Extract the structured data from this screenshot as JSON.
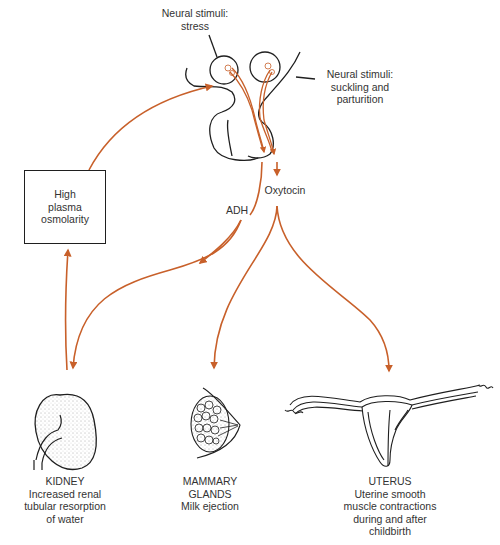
{
  "diagram": {
    "colors": {
      "arrow": "#c8602a",
      "outline": "#1f1f1f",
      "text": "#333333"
    },
    "stimuli": {
      "stress": [
        "Neural stimuli:",
        "stress"
      ],
      "suckling": [
        "Neural stimuli:",
        "suckling and",
        "parturition"
      ]
    },
    "box": {
      "lines": [
        "High",
        "plasma",
        "osmolarity"
      ]
    },
    "hormones": {
      "adh": "ADH",
      "oxytocin": "Oxytocin"
    },
    "targets": {
      "kidney": {
        "name": "KIDNEY",
        "lines": [
          "Increased renal",
          "tubular resorption",
          "of water"
        ]
      },
      "mammary": {
        "name": "MAMMARY",
        "name2": "GLANDS",
        "lines": [
          "Milk ejection"
        ]
      },
      "uterus": {
        "name": "UTERUS",
        "lines": [
          "Uterine smooth",
          "muscle contractions",
          "during and after",
          "childbirth"
        ]
      }
    }
  }
}
